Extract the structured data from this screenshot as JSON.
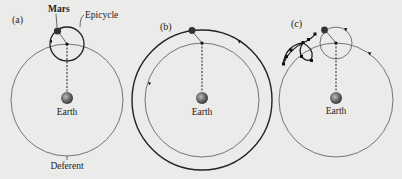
{
  "figure": {
    "background": "#ebebea",
    "panels": [
      {
        "id": "a",
        "label": "(a)",
        "planet_label": "Mars",
        "epicycle_label": "Epicycle",
        "center_label": "Earth",
        "deferent_label": "Deferent"
      },
      {
        "id": "b",
        "label": "(b)",
        "center_label": "Earth"
      },
      {
        "id": "c",
        "label": "(c)",
        "center_label": "Earth"
      }
    ]
  }
}
